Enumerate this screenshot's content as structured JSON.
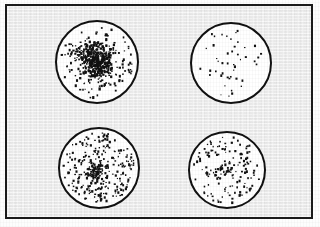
{
  "figure": {
    "background_color": "#fdfdfd",
    "frame": {
      "border_color": "#1b1b1b",
      "fill_color": "#eeeeee",
      "x": 5,
      "y": 4,
      "width": 308,
      "height": 215
    },
    "dot_color": "#111111",
    "circle_fill_color": "#ffffff",
    "circle_border_color": "#111111"
  },
  "chart_data": {
    "type": "scatter",
    "title": "",
    "xlabel": "",
    "ylabel": "",
    "grid": false,
    "legend": false,
    "panels": [
      {
        "id": "panel-top-left",
        "position": "top-left",
        "pattern": "clustered",
        "dot_count": 560,
        "cx": 97,
        "cy": 62,
        "r": 42,
        "dot_size": 1.7,
        "cluster_strength": 0.72,
        "cluster_centers": [
          [
            0.46,
            0.34
          ],
          [
            0.54,
            0.46
          ],
          [
            0.4,
            0.5
          ],
          [
            0.58,
            0.58
          ],
          [
            0.48,
            0.62
          ],
          [
            0.35,
            0.4
          ],
          [
            0.62,
            0.4
          ],
          [
            0.5,
            0.52
          ]
        ],
        "seed": 1101
      },
      {
        "id": "panel-top-right",
        "position": "top-right",
        "pattern": "sparse-random",
        "dot_count": 46,
        "cx": 231,
        "cy": 63,
        "r": 41,
        "dot_size": 1.5,
        "cluster_strength": 0.0,
        "cluster_centers": [],
        "seed": 2202
      },
      {
        "id": "panel-bottom-left",
        "position": "bottom-left",
        "pattern": "dense-random",
        "dot_count": 330,
        "cx": 99,
        "cy": 168,
        "r": 41,
        "dot_size": 1.6,
        "cluster_strength": 0.18,
        "cluster_centers": [
          [
            0.47,
            0.55
          ]
        ],
        "seed": 3303
      },
      {
        "id": "panel-bottom-right",
        "position": "bottom-right",
        "pattern": "medium-random",
        "dot_count": 165,
        "cx": 227,
        "cy": 170,
        "r": 39,
        "dot_size": 1.6,
        "cluster_strength": 0.14,
        "cluster_centers": [
          [
            0.46,
            0.52
          ]
        ],
        "seed": 4404
      }
    ]
  }
}
